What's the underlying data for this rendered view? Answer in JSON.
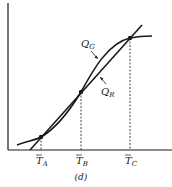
{
  "figure": {
    "caption": "(d)",
    "colors": {
      "ink": "#1a1a1a",
      "background": "#ffffff"
    },
    "curves": [
      {
        "id": "QG",
        "label_main": "Q",
        "label_sub": "G",
        "kind": "sigmoid"
      },
      {
        "id": "QR",
        "label_main": "Q",
        "label_sub": "R",
        "kind": "straight-line"
      }
    ],
    "intersections": [
      {
        "label_main": "T",
        "label_sub": "A"
      },
      {
        "label_main": "T",
        "label_sub": "B"
      },
      {
        "label_main": "T",
        "label_sub": "C"
      }
    ]
  }
}
